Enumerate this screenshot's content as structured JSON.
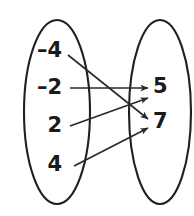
{
  "diagram": {
    "type": "mapping-diagram",
    "domain_set": {
      "name": "domain-oval",
      "elements": [
        {
          "label": "–4",
          "value": -4,
          "x": 62,
          "y": 51
        },
        {
          "label": "–2",
          "value": -2,
          "x": 62,
          "y": 88
        },
        {
          "label": "2",
          "value": 2,
          "x": 62,
          "y": 126
        },
        {
          "label": "4",
          "value": 4,
          "x": 62,
          "y": 165
        }
      ]
    },
    "range_set": {
      "name": "range-oval",
      "elements": [
        {
          "label": "5",
          "value": 5,
          "x": 153,
          "y": 87
        },
        {
          "label": "7",
          "value": 7,
          "x": 153,
          "y": 122
        }
      ]
    },
    "mappings": [
      {
        "from": "–4",
        "to": "7",
        "x1": 68,
        "y1": 55,
        "x2": 148,
        "y2": 119
      },
      {
        "from": "–2",
        "to": "5",
        "x1": 70,
        "y1": 88,
        "x2": 148,
        "y2": 88
      },
      {
        "from": "2",
        "to": "5",
        "x1": 70,
        "y1": 126,
        "x2": 148,
        "y2": 98
      },
      {
        "from": "4",
        "to": "7",
        "x1": 74,
        "y1": 166,
        "x2": 148,
        "y2": 128
      }
    ],
    "ovals": [
      {
        "name": "left",
        "cx": 57,
        "cy": 112,
        "rx": 33,
        "ry": 92
      },
      {
        "name": "right",
        "cx": 160,
        "cy": 112,
        "rx": 31,
        "ry": 92
      }
    ],
    "colors": {
      "stroke": "#211f1f",
      "arrow": "#2b2929",
      "text": "#1b1a1a",
      "background": "#ffffff"
    }
  }
}
